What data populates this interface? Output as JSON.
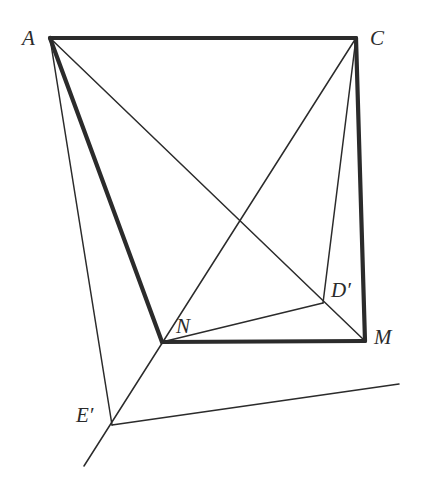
{
  "figure": {
    "type": "geometric-diagram",
    "width": 432,
    "height": 481,
    "background_color": "#ffffff",
    "stroke_color": "#2b2b2b",
    "thick_stroke_width": 4.2,
    "thin_stroke_width": 1.5,
    "vertices": [
      {
        "id": "A",
        "label": "A",
        "x": 50,
        "y": 38,
        "label_x": 22,
        "label_y": 28
      },
      {
        "id": "C",
        "label": "C",
        "x": 356,
        "y": 38,
        "label_x": 370,
        "label_y": 28
      },
      {
        "id": "N",
        "label": "N",
        "x": 162,
        "y": 342,
        "label_x": 176,
        "label_y": 316
      },
      {
        "id": "M",
        "label": "M",
        "x": 365,
        "y": 341,
        "label_x": 374,
        "label_y": 327
      },
      {
        "id": "Dp",
        "label": "D′",
        "x": 323,
        "y": 303,
        "label_x": 331,
        "label_y": 280
      },
      {
        "id": "Ep",
        "label": "E′",
        "x": 112,
        "y": 425,
        "label_x": 76,
        "label_y": 405
      }
    ],
    "thick_segments": [
      {
        "name": "segment-A-C",
        "from": "A",
        "to": "C",
        "x1": 50,
        "y1": 38,
        "x2": 356,
        "y2": 38
      },
      {
        "name": "segment-C-M",
        "from": "C",
        "to": "M",
        "x1": 356,
        "y1": 38,
        "x2": 365,
        "y2": 341
      },
      {
        "name": "segment-M-N",
        "from": "M",
        "to": "N",
        "x1": 365,
        "y1": 341,
        "x2": 162,
        "y2": 342
      },
      {
        "name": "segment-N-A",
        "from": "N",
        "to": "A",
        "x1": 162,
        "y1": 342,
        "x2": 50,
        "y2": 38
      }
    ],
    "thin_segments": [
      {
        "name": "segment-A-M",
        "from": "A",
        "to": "M",
        "x1": 50,
        "y1": 38,
        "x2": 365,
        "y2": 341
      },
      {
        "name": "segment-A-Ep",
        "from": "A",
        "to": "E′",
        "x1": 50,
        "y1": 38,
        "x2": 112,
        "y2": 425
      },
      {
        "name": "segment-C-Ep",
        "from": "C",
        "to": "E′",
        "x1": 356,
        "y1": 38,
        "x2": 84,
        "y2": 466
      },
      {
        "name": "segment-C-Dp",
        "from": "C",
        "to": "D′",
        "x1": 356,
        "y1": 38,
        "x2": 323,
        "y2": 303
      },
      {
        "name": "segment-N-Dp",
        "from": "N",
        "to": "D′",
        "x1": 162,
        "y1": 342,
        "x2": 323,
        "y2": 303
      },
      {
        "name": "segment-Ep-Dp-extended",
        "from": "E′",
        "to": "D′",
        "x1": 112,
        "y1": 425,
        "x2": 399,
        "y2": 384
      }
    ]
  }
}
